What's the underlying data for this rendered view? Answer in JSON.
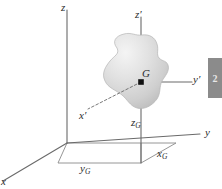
{
  "figure": {
    "background_color": "#ffffff",
    "axis_color": "#6a6a6a",
    "label_color": "#2b2b2b",
    "body_fill": "#d8d8d8",
    "point_color": "#000000",
    "width": 222,
    "height": 189
  },
  "labels": {
    "z": {
      "text": "z",
      "x": 61,
      "y": 2
    },
    "z_prime": {
      "text": "z",
      "prime": "′",
      "x": 135,
      "y": 9
    },
    "y": {
      "text": "y",
      "x": 205,
      "y": 127
    },
    "y_prime": {
      "text": "y",
      "prime": "′",
      "x": 193,
      "y": 74
    },
    "x": {
      "text": "x",
      "x": 1,
      "y": 176
    },
    "x_prime": {
      "text": "x",
      "prime": "′",
      "x": 79,
      "y": 110
    },
    "G": {
      "text": "G",
      "x": 142,
      "y": 68
    },
    "x_G": {
      "base": "x",
      "sub": "G",
      "x": 157,
      "y": 148
    },
    "y_G": {
      "base": "y",
      "sub": "G",
      "x": 80,
      "y": 163
    },
    "z_G": {
      "base": "z",
      "sub": "G",
      "x": 131,
      "y": 117
    }
  },
  "geometry": {
    "origin": {
      "x": 67,
      "y": 143
    },
    "centroid": {
      "x": 141,
      "y": 82
    },
    "z_axis_top": {
      "x": 67,
      "y": 10
    },
    "z_prime_top": {
      "x": 141,
      "y": 17
    },
    "y_axis_end": {
      "x": 200,
      "y": 134
    },
    "x_axis_end": {
      "x": 3,
      "y": 181
    },
    "y_prime_end": {
      "x": 192,
      "y": 82
    },
    "x_prime_end": {
      "x": 88,
      "y": 109
    },
    "foot": {
      "x": 141,
      "y": 163
    },
    "box_corner_right": {
      "x": 176,
      "y": 143
    },
    "box_corner_left": {
      "x": 58,
      "y": 163
    }
  },
  "side_tab": {
    "glyph": "2",
    "color": "#8b8b8b"
  }
}
